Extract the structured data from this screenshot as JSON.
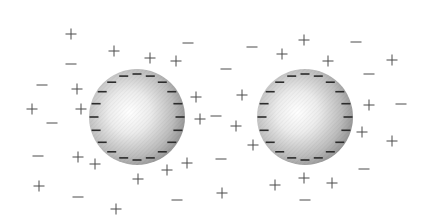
{
  "diagram": {
    "title": "",
    "colors": {
      "background": "#ffffff",
      "particle_edge": "#8e8e8e",
      "particle_highlight": "#ffffff",
      "surface_charge": "#2b2b2b",
      "ion": "#4a4a4a"
    },
    "particles": [
      {
        "id": "particle-left",
        "cx": 137,
        "cy": 117,
        "r": 48,
        "highlight": {
          "cx": 0.42,
          "cy": 0.45
        },
        "surface_charge": "-",
        "surface_charge_count": 20
      },
      {
        "id": "particle-right",
        "cx": 305,
        "cy": 117,
        "r": 48,
        "highlight": {
          "cx": 0.42,
          "cy": 0.45
        },
        "surface_charge": "-",
        "surface_charge_count": 20
      }
    ],
    "ions": [
      {
        "sign": "+",
        "x": 71,
        "y": 34
      },
      {
        "sign": "+",
        "x": 114,
        "y": 51
      },
      {
        "sign": "+",
        "x": 150,
        "y": 58
      },
      {
        "sign": "+",
        "x": 176,
        "y": 61
      },
      {
        "sign": "-",
        "x": 188,
        "y": 43
      },
      {
        "sign": "-",
        "x": 71,
        "y": 64
      },
      {
        "sign": "-",
        "x": 42,
        "y": 85
      },
      {
        "sign": "+",
        "x": 77,
        "y": 89
      },
      {
        "sign": "+",
        "x": 32,
        "y": 109
      },
      {
        "sign": "+",
        "x": 81,
        "y": 109
      },
      {
        "sign": "-",
        "x": 52,
        "y": 123
      },
      {
        "sign": "-",
        "x": 38,
        "y": 156
      },
      {
        "sign": "+",
        "x": 78,
        "y": 157
      },
      {
        "sign": "+",
        "x": 95,
        "y": 164
      },
      {
        "sign": "+",
        "x": 39,
        "y": 186
      },
      {
        "sign": "-",
        "x": 78,
        "y": 197
      },
      {
        "sign": "+",
        "x": 138,
        "y": 179
      },
      {
        "sign": "+",
        "x": 167,
        "y": 170
      },
      {
        "sign": "+",
        "x": 116,
        "y": 209
      },
      {
        "sign": "-",
        "x": 177,
        "y": 200
      },
      {
        "sign": "+",
        "x": 196,
        "y": 97
      },
      {
        "sign": "+",
        "x": 200,
        "y": 119
      },
      {
        "sign": "-",
        "x": 216,
        "y": 116
      },
      {
        "sign": "+",
        "x": 187,
        "y": 163
      },
      {
        "sign": "-",
        "x": 226,
        "y": 69
      },
      {
        "sign": "-",
        "x": 252,
        "y": 47
      },
      {
        "sign": "+",
        "x": 282,
        "y": 54
      },
      {
        "sign": "+",
        "x": 304,
        "y": 40
      },
      {
        "sign": "+",
        "x": 328,
        "y": 61
      },
      {
        "sign": "-",
        "x": 356,
        "y": 42
      },
      {
        "sign": "-",
        "x": 369,
        "y": 74
      },
      {
        "sign": "+",
        "x": 392,
        "y": 60
      },
      {
        "sign": "+",
        "x": 242,
        "y": 95
      },
      {
        "sign": "+",
        "x": 236,
        "y": 126
      },
      {
        "sign": "+",
        "x": 253,
        "y": 145
      },
      {
        "sign": "+",
        "x": 369,
        "y": 105
      },
      {
        "sign": "-",
        "x": 401,
        "y": 104
      },
      {
        "sign": "+",
        "x": 362,
        "y": 132
      },
      {
        "sign": "+",
        "x": 392,
        "y": 141
      },
      {
        "sign": "-",
        "x": 221,
        "y": 159
      },
      {
        "sign": "+",
        "x": 222,
        "y": 193
      },
      {
        "sign": "+",
        "x": 275,
        "y": 185
      },
      {
        "sign": "+",
        "x": 304,
        "y": 178
      },
      {
        "sign": "+",
        "x": 332,
        "y": 183
      },
      {
        "sign": "-",
        "x": 305,
        "y": 200
      },
      {
        "sign": "-",
        "x": 364,
        "y": 169
      }
    ]
  }
}
